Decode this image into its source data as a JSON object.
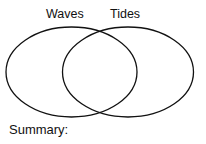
{
  "diagram": {
    "type": "venn",
    "sets": [
      {
        "label": "Waves"
      },
      {
        "label": "Tides"
      }
    ],
    "summary_label": "Summary:",
    "stroke_color": "#111111",
    "background": "#ffffff"
  }
}
